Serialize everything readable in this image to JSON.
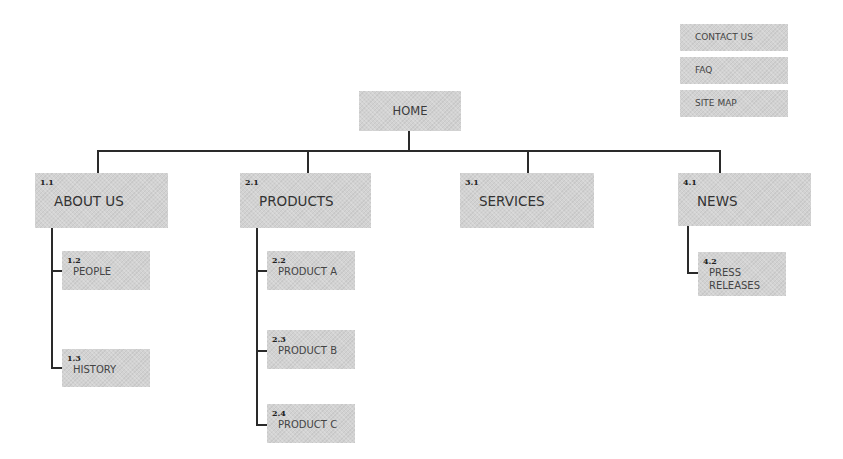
{
  "utility_nav": [
    {
      "label": "CONTACT US"
    },
    {
      "label": "FAQ"
    },
    {
      "label": "SITE MAP"
    }
  ],
  "home": {
    "label": "HOME"
  },
  "sections": [
    {
      "number": "1.1",
      "label": "ABOUT US",
      "children": [
        {
          "number": "1.2",
          "label": "PEOPLE"
        },
        {
          "number": "1.3",
          "label": "HISTORY"
        }
      ]
    },
    {
      "number": "2.1",
      "label": "PRODUCTS",
      "children": [
        {
          "number": "2.2",
          "label": "PRODUCT A"
        },
        {
          "number": "2.3",
          "label": "PRODUCT B"
        },
        {
          "number": "2.4",
          "label": "PRODUCT C"
        }
      ]
    },
    {
      "number": "3.1",
      "label": "SERVICES",
      "children": []
    },
    {
      "number": "4.1",
      "label": "NEWS",
      "children": [
        {
          "number": "4.2",
          "label": "PRESS RELEASES",
          "line1": "PRESS",
          "line2": "RELEASES"
        }
      ]
    }
  ],
  "colors": {
    "box_fill": "#d2d2d2",
    "connector": "#2a2a2a",
    "text": "#3a3a3a"
  }
}
